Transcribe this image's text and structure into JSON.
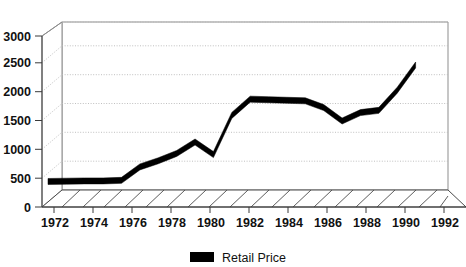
{
  "chart_data": {
    "type": "line",
    "title": "",
    "xlabel": "",
    "ylabel": "",
    "x": [
      1972,
      1973,
      1974,
      1975,
      1976,
      1977,
      1978,
      1979,
      1980,
      1981,
      1982,
      1983,
      1984,
      1985,
      1986,
      1987,
      1988,
      1989,
      1990,
      1991,
      1992
    ],
    "series": [
      {
        "name": "Retail Price",
        "color": "#000000",
        "values": [
          420,
          425,
          430,
          430,
          440,
          680,
          790,
          920,
          1125,
          900,
          1600,
          1890,
          1880,
          1870,
          1860,
          1740,
          1500,
          1650,
          1690,
          2050,
          2500
        ]
      }
    ],
    "ylim": [
      0,
      3000
    ],
    "ytick_labels": [
      "0",
      "500",
      "1000",
      "1500",
      "2000",
      "2500",
      "3000"
    ],
    "ytick_values": [
      0,
      500,
      1000,
      1500,
      2000,
      2500,
      3000
    ],
    "xtick_labels": [
      "1972",
      "1974",
      "1976",
      "1978",
      "1980",
      "1982",
      "1984",
      "1986",
      "1988",
      "1990",
      "1992"
    ],
    "xtick_values": [
      1972,
      1974,
      1976,
      1978,
      1980,
      1982,
      1984,
      1986,
      1988,
      1990,
      1992
    ],
    "xlim": [
      1972,
      1993
    ],
    "grid": true,
    "grid_axis": "y",
    "legend_position": "bottom-center",
    "style": "3d-perspective",
    "colors": {
      "series": "#000000",
      "grid": "#b9b9b9",
      "axis": "#3a3a3a",
      "wall": "#8d8d8d",
      "background": "#ffffff"
    }
  },
  "legend": {
    "entries": [
      {
        "label": "Retail Price",
        "color": "#000000"
      }
    ]
  }
}
